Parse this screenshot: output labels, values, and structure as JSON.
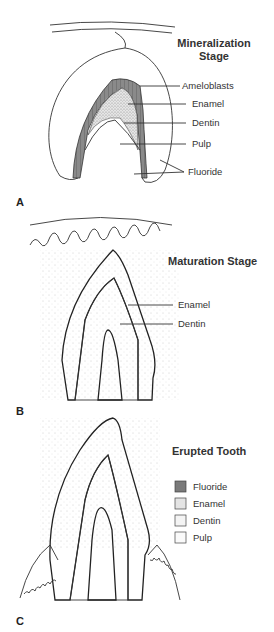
{
  "panels": [
    {
      "letter": "A",
      "title_line1": "Mineralization",
      "title_line2": "Stage",
      "labels": [
        "Ameloblasts",
        "Enamel",
        "Dentin",
        "Pulp",
        "Fluoride"
      ]
    },
    {
      "letter": "B",
      "title": "Maturation Stage",
      "labels": [
        "Enamel",
        "Dentin"
      ]
    },
    {
      "letter": "C",
      "title": "Erupted Tooth",
      "legend": [
        {
          "label": "Fluoride",
          "color": "#7a7a7a"
        },
        {
          "label": "Enamel",
          "color": "#e4e4e4"
        },
        {
          "label": "Dentin",
          "color": "#f4f4f4"
        },
        {
          "label": "Pulp",
          "color": "#fafafa"
        }
      ]
    }
  ]
}
